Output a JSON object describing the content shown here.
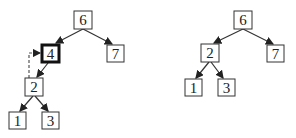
{
  "diagram": {
    "left_tree": {
      "nodes": [
        {
          "id": "L6",
          "label": "6",
          "x": 83,
          "y": 20
        },
        {
          "id": "L4",
          "label": "4",
          "x": 50,
          "y": 53,
          "highlighted": true
        },
        {
          "id": "L7",
          "label": "7",
          "x": 115,
          "y": 53
        },
        {
          "id": "L2",
          "label": "2",
          "x": 34,
          "y": 87
        },
        {
          "id": "L1",
          "label": "1",
          "x": 17,
          "y": 120
        },
        {
          "id": "L3",
          "label": "3",
          "x": 50,
          "y": 120
        }
      ],
      "edges": [
        [
          "L6",
          "L4"
        ],
        [
          "L6",
          "L7"
        ],
        [
          "L4",
          "L2"
        ],
        [
          "L2",
          "L1"
        ],
        [
          "L2",
          "L3"
        ]
      ],
      "dashed_arrow": {
        "from": "L2",
        "to": "L4"
      }
    },
    "right_tree": {
      "nodes": [
        {
          "id": "R6",
          "label": "6",
          "x": 243,
          "y": 20
        },
        {
          "id": "R2",
          "label": "2",
          "x": 210,
          "y": 53
        },
        {
          "id": "R7",
          "label": "7",
          "x": 276,
          "y": 53
        },
        {
          "id": "R1",
          "label": "1",
          "x": 193,
          "y": 88
        },
        {
          "id": "R3",
          "label": "3",
          "x": 226,
          "y": 88
        }
      ],
      "edges": [
        [
          "R6",
          "R2"
        ],
        [
          "R6",
          "R7"
        ],
        [
          "R2",
          "R1"
        ],
        [
          "R2",
          "R3"
        ]
      ]
    },
    "colors": {
      "stroke": "#333333",
      "text": "#222222",
      "background": "#ffffff"
    }
  }
}
